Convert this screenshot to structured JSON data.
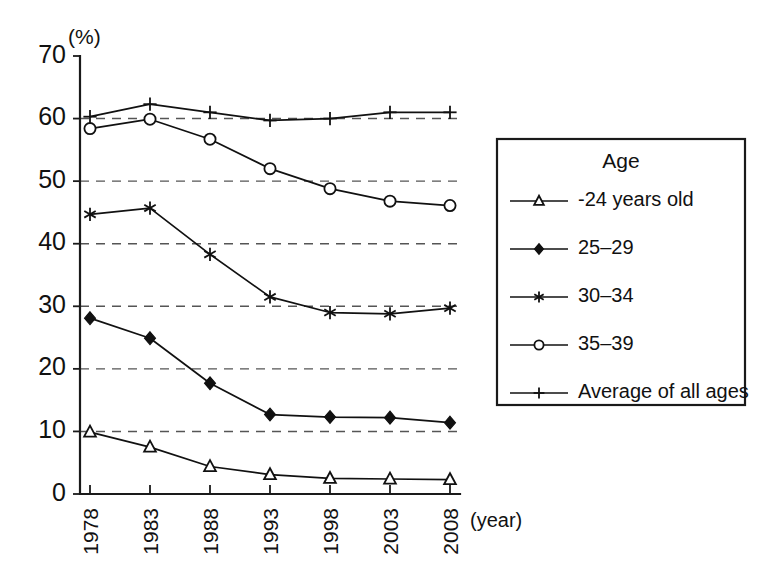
{
  "chart_data": {
    "type": "line",
    "title": "",
    "xlabel": "(year)",
    "ylabel": "(%)",
    "categories": [
      "1978",
      "1983",
      "1988",
      "1993",
      "1998",
      "2003",
      "2008"
    ],
    "ylim": [
      0,
      70
    ],
    "ytick_step": 10,
    "yticks": [
      "0",
      "10",
      "20",
      "30",
      "40",
      "50",
      "60",
      "70"
    ],
    "grid": "horizontal-dashed",
    "legend_position": "right-outside",
    "legend_title": "Age",
    "series": [
      {
        "name": "-24 years old",
        "marker": "open-triangle",
        "values": [
          9.9,
          7.5,
          4.4,
          3.1,
          2.5,
          2.4,
          2.3
        ]
      },
      {
        "name": "25–29",
        "marker": "filled-diamond",
        "values": [
          28.1,
          24.9,
          17.7,
          12.7,
          12.3,
          12.2,
          11.4
        ]
      },
      {
        "name": "30–34",
        "marker": "asterisk",
        "values": [
          44.7,
          45.7,
          38.3,
          31.5,
          29.0,
          28.8,
          29.7
        ]
      },
      {
        "name": "35–39",
        "marker": "open-circle",
        "values": [
          58.4,
          59.9,
          56.7,
          52.0,
          48.8,
          46.8,
          46.1
        ]
      },
      {
        "name": "Average of all ages",
        "marker": "plus",
        "values": [
          60.3,
          62.3,
          61.0,
          59.7,
          60.0,
          61.0,
          61.0
        ]
      }
    ]
  },
  "axes": {
    "unit_label": "(%)",
    "x_axis_title": "(year)"
  },
  "legend": {
    "title": "Age",
    "entries": [
      {
        "label": "-24 years old",
        "marker": "open-triangle"
      },
      {
        "label": "25–29",
        "marker": "filled-diamond"
      },
      {
        "label": "30–34",
        "marker": "asterisk"
      },
      {
        "label": "35–39",
        "marker": "open-circle"
      },
      {
        "label": "Average of all ages",
        "marker": "plus"
      }
    ]
  },
  "colors": {
    "ink": "#111111",
    "grid": "#555555",
    "background": "#ffffff"
  }
}
